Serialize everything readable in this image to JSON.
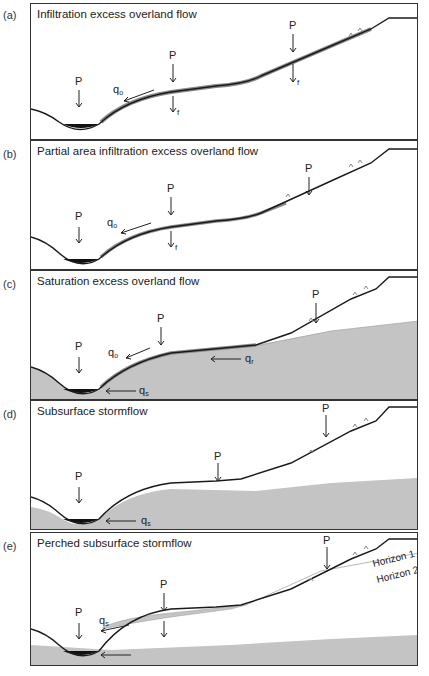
{
  "figure": {
    "panels": [
      {
        "letter": "(a)",
        "title": "Infiltration excess overland flow",
        "labels": {
          "p1": "P",
          "p2": "P",
          "p3": "P",
          "qo": "q",
          "qo_sub": "o",
          "f1": "f",
          "f2": "f"
        }
      },
      {
        "letter": "(b)",
        "title": "Partial area infiltration excess overland flow",
        "labels": {
          "p1": "P",
          "p2": "P",
          "p3": "P",
          "qo": "q",
          "qo_sub": "o",
          "f1": "f"
        }
      },
      {
        "letter": "(c)",
        "title": "Saturation excess overland flow",
        "labels": {
          "p1": "P",
          "p2": "P",
          "p3": "P",
          "qo": "q",
          "qo_sub": "o",
          "qr": "q",
          "qr_sub": "r",
          "qs": "q",
          "qs_sub": "s"
        }
      },
      {
        "letter": "(d)",
        "title": "Subsurface stormflow",
        "labels": {
          "p1": "P",
          "p2": "P",
          "p3": "P",
          "qs": "q",
          "qs_sub": "s"
        }
      },
      {
        "letter": "(e)",
        "title": "Perched subsurface stormflow",
        "labels": {
          "p1": "P",
          "p2": "P",
          "p3": "P",
          "qs": "q",
          "qs_sub": "s",
          "horizon1": "Horizon 1",
          "horizon2": "Horizon 2"
        }
      }
    ],
    "colors": {
      "ground_line": "#1a1a1a",
      "saturated_fill": "#c4c4c4",
      "overland_flow": "#8a8a8a",
      "channel_water": "#111111",
      "border": "#333333"
    }
  }
}
